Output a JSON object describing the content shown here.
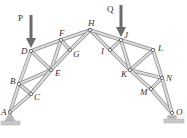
{
  "colors": {
    "member_fill": "#dcdcdc",
    "member_edge": "#8a8a8a",
    "node": "#555555",
    "load_arrow": "#666666",
    "support": "#b0b0b0"
  },
  "loads": [
    {
      "label": "P",
      "node": "D",
      "direction": "down"
    },
    {
      "label": "Q",
      "node": "J",
      "direction": "down"
    }
  ],
  "nodes": [
    {
      "id": "A",
      "label": "A"
    },
    {
      "id": "B",
      "label": "B"
    },
    {
      "id": "C",
      "label": "C"
    },
    {
      "id": "D",
      "label": "D"
    },
    {
      "id": "E",
      "label": "E"
    },
    {
      "id": "F",
      "label": "F"
    },
    {
      "id": "G",
      "label": "G"
    },
    {
      "id": "H",
      "label": "H"
    },
    {
      "id": "I",
      "label": "I"
    },
    {
      "id": "J",
      "label": "J"
    },
    {
      "id": "K",
      "label": "K"
    },
    {
      "id": "L",
      "label": "L"
    },
    {
      "id": "M",
      "label": "M"
    },
    {
      "id": "N",
      "label": "N"
    },
    {
      "id": "O",
      "label": "O"
    }
  ],
  "members": [
    [
      "A",
      "B"
    ],
    [
      "A",
      "C"
    ],
    [
      "B",
      "C"
    ],
    [
      "B",
      "D"
    ],
    [
      "B",
      "E"
    ],
    [
      "C",
      "E"
    ],
    [
      "D",
      "E"
    ],
    [
      "D",
      "F"
    ],
    [
      "E",
      "F"
    ],
    [
      "E",
      "G"
    ],
    [
      "F",
      "G"
    ],
    [
      "F",
      "H"
    ],
    [
      "G",
      "H"
    ],
    [
      "H",
      "I"
    ],
    [
      "H",
      "J"
    ],
    [
      "I",
      "J"
    ],
    [
      "I",
      "K"
    ],
    [
      "J",
      "K"
    ],
    [
      "J",
      "L"
    ],
    [
      "K",
      "L"
    ],
    [
      "K",
      "N"
    ],
    [
      "K",
      "M"
    ],
    [
      "L",
      "N"
    ],
    [
      "M",
      "N"
    ],
    [
      "M",
      "O"
    ],
    [
      "N",
      "O"
    ]
  ],
  "supports": [
    {
      "node": "A",
      "type": "pin"
    },
    {
      "node": "O",
      "type": "roller"
    }
  ]
}
